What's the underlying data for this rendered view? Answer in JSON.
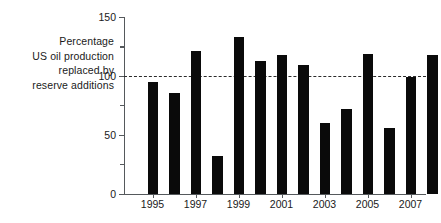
{
  "chart_data": {
    "type": "bar",
    "title": "",
    "subtitle": "",
    "xlabel": "",
    "ylabel": "Percentage US oil production replaced by reserve additions",
    "ylabel_lines": [
      "Percentage",
      "US oil production",
      "replaced by",
      "reserve additions"
    ],
    "categories": [
      "1995",
      "1996",
      "1997",
      "1998",
      "1999",
      "2000",
      "2001",
      "2002",
      "2003",
      "2004",
      "2005",
      "2006",
      "2007",
      "2008"
    ],
    "values": [
      95,
      86,
      121,
      32,
      133,
      113,
      118,
      109,
      60,
      72,
      119,
      56,
      99,
      118
    ],
    "ylim": [
      0,
      150
    ],
    "xlim_labels": [
      "1995",
      "1997",
      "1999",
      "2001",
      "2003",
      "2005",
      "2007"
    ],
    "y_ticks_major": [
      0,
      50,
      100,
      150
    ],
    "y_ticks_minor": [
      25,
      75,
      125
    ],
    "y_tick_labels": [
      "0",
      "50",
      "100",
      "150"
    ],
    "x_tick_labels": [
      "1995",
      "1997",
      "1999",
      "2001",
      "2003",
      "2005",
      "2007"
    ],
    "reference_line": {
      "value": 100,
      "style": "dashed",
      "label": ""
    },
    "grid": false,
    "legend": null,
    "legend_position": "none",
    "bar_color": "#0a0a0a",
    "axis_color": "#55595c",
    "text_color": "#1a1a1a",
    "background_color": "#ffffff"
  }
}
